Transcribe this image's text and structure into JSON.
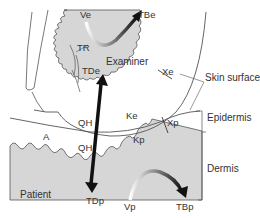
{
  "diagram": {
    "regions": {
      "examiner": "Examiner",
      "patient": "Patient"
    },
    "labels": {
      "ve": "Ve",
      "tbe": "TBe",
      "tr": "TR",
      "tde": "TDe",
      "xe": "Xe",
      "ke": "Ke",
      "qh_upper": "QH",
      "qh_lower": "QH",
      "a": "A",
      "kp": "Kp",
      "xp": "Xp",
      "tdp": "TDp",
      "vp": "Vp",
      "tbp": "TBp"
    },
    "layer_labels": {
      "skin_surface": "Skin surface",
      "epidermis": "Epidermis",
      "dermis": "Dermis"
    },
    "colors": {
      "tissue_fill": "#d6d6d6",
      "outline": "#555555",
      "arrow": "#111111",
      "background": "#ffffff"
    }
  }
}
